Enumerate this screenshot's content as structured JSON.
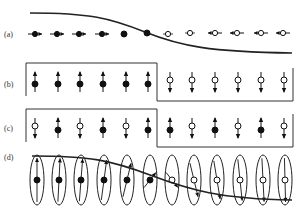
{
  "figure": {
    "panels": [
      {
        "id": "a",
        "label": "(a)",
        "description": "spin chain with sigmoid potential curve; spins lie horizontally",
        "spins": [
          {
            "x": 35,
            "y": 34,
            "fill": "filled",
            "dir": "right"
          },
          {
            "x": 57,
            "y": 34,
            "fill": "filled",
            "dir": "right"
          },
          {
            "x": 79,
            "y": 34,
            "fill": "filled",
            "dir": "right"
          },
          {
            "x": 102,
            "y": 34,
            "fill": "filled",
            "dir": "right"
          },
          {
            "x": 124,
            "y": 34,
            "fill": "filled",
            "dir": "none"
          },
          {
            "x": 147,
            "y": 33,
            "fill": "filled",
            "dir": "none"
          },
          {
            "x": 168,
            "y": 34,
            "fill": "open",
            "dir": "none"
          },
          {
            "x": 190,
            "y": 33,
            "fill": "open",
            "dir": "none"
          },
          {
            "x": 215,
            "y": 33,
            "fill": "open",
            "dir": "left"
          },
          {
            "x": 237,
            "y": 33,
            "fill": "open",
            "dir": "left"
          },
          {
            "x": 261,
            "y": 33,
            "fill": "open",
            "dir": "left"
          },
          {
            "x": 283,
            "y": 33,
            "fill": "open",
            "dir": "left"
          }
        ]
      },
      {
        "id": "b",
        "label": "(b)",
        "description": "step potential; up spins (filled) left, down spins (open) right",
        "spins": [
          {
            "x": 35,
            "fill": "filled",
            "dir": "up"
          },
          {
            "x": 58,
            "fill": "filled",
            "dir": "up"
          },
          {
            "x": 80,
            "fill": "filled",
            "dir": "up"
          },
          {
            "x": 103,
            "fill": "filled",
            "dir": "up"
          },
          {
            "x": 126,
            "fill": "filled",
            "dir": "up"
          },
          {
            "x": 148,
            "fill": "filled",
            "dir": "up"
          },
          {
            "x": 170,
            "fill": "open",
            "dir": "down"
          },
          {
            "x": 192,
            "fill": "open",
            "dir": "down"
          },
          {
            "x": 215,
            "fill": "open",
            "dir": "down"
          },
          {
            "x": 238,
            "fill": "open",
            "dir": "down"
          },
          {
            "x": 261,
            "fill": "open",
            "dir": "down"
          },
          {
            "x": 284,
            "fill": "open",
            "dir": "down"
          }
        ]
      },
      {
        "id": "c",
        "label": "(c)",
        "description": "step potential; alternating antiferromagnetic spins",
        "spins": [
          {
            "x": 35,
            "fill": "open",
            "dir": "down"
          },
          {
            "x": 58,
            "fill": "filled",
            "dir": "up"
          },
          {
            "x": 80,
            "fill": "open",
            "dir": "down"
          },
          {
            "x": 103,
            "fill": "filled",
            "dir": "up"
          },
          {
            "x": 126,
            "fill": "open",
            "dir": "down"
          },
          {
            "x": 148,
            "fill": "filled",
            "dir": "up"
          },
          {
            "x": 170,
            "fill": "filled",
            "dir": "up"
          },
          {
            "x": 192,
            "fill": "open",
            "dir": "down"
          },
          {
            "x": 215,
            "fill": "filled",
            "dir": "up"
          },
          {
            "x": 238,
            "fill": "open",
            "dir": "down"
          },
          {
            "x": 261,
            "fill": "filled",
            "dir": "up"
          },
          {
            "x": 284,
            "fill": "open",
            "dir": "down"
          }
        ]
      },
      {
        "id": "d",
        "label": "(d)",
        "description": "spins in elliptical orbitals rotating along sigmoid curve",
        "ellipses": [
          {
            "x": 37,
            "fill": "filled",
            "angle": 0
          },
          {
            "x": 59,
            "fill": "filled",
            "angle": 10
          },
          {
            "x": 81,
            "fill": "filled",
            "angle": 15
          },
          {
            "x": 104,
            "fill": "filled",
            "angle": 25
          },
          {
            "x": 127,
            "fill": "filled",
            "angle": 40
          },
          {
            "x": 150,
            "fill": "filled",
            "angle": 70
          },
          {
            "x": 172,
            "fill": "open",
            "angle": 110
          },
          {
            "x": 194,
            "fill": "open",
            "angle": 140
          },
          {
            "x": 217,
            "fill": "open",
            "angle": 150
          },
          {
            "x": 240,
            "fill": "open",
            "angle": 160
          },
          {
            "x": 263,
            "fill": "open",
            "angle": 170
          },
          {
            "x": 285,
            "fill": "open",
            "angle": 175
          }
        ]
      }
    ]
  }
}
